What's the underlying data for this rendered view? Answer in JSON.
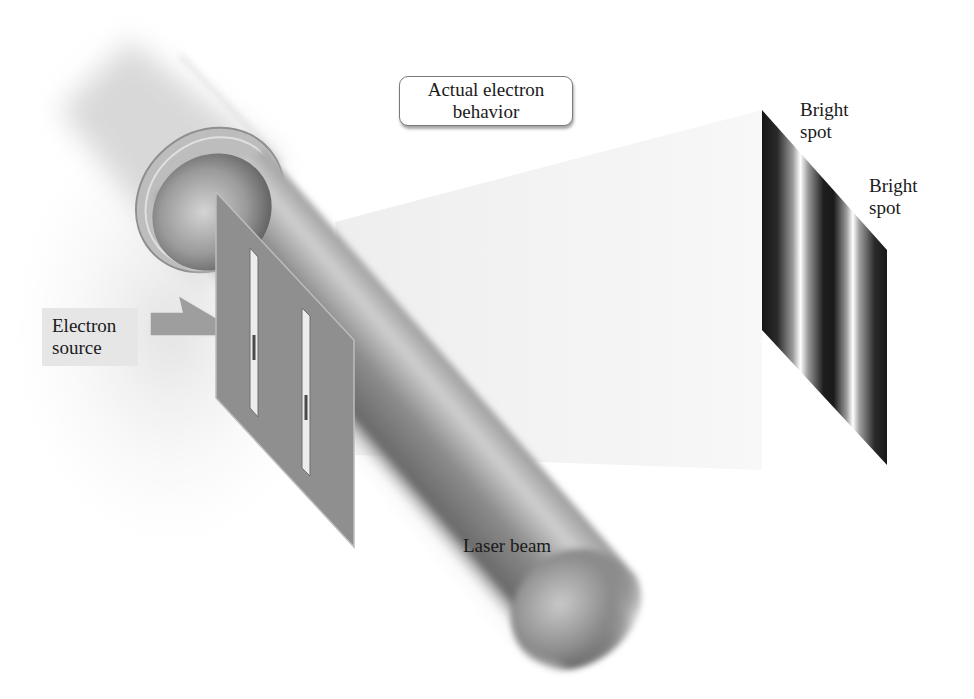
{
  "diagram": {
    "title_callout": {
      "line1": "Actual electron",
      "line2": "behavior"
    },
    "labels": {
      "electron_source": {
        "line1": "Electron",
        "line2": "source"
      },
      "laser_beam": "Laser beam",
      "bright_spot_1": {
        "line1": "Bright",
        "line2": "spot"
      },
      "bright_spot_2": {
        "line1": "Bright",
        "line2": "spot"
      }
    },
    "components": [
      "electron-source-arrow",
      "double-slit-plate",
      "laser-beam-cylinder",
      "detection-screen-interference-pattern",
      "projection-cone"
    ],
    "colors": {
      "background": "#ffffff",
      "plate": "#8c8c8c",
      "beam_dark": "#555555",
      "beam_light": "#d8d8d8",
      "screen_dark": "#111111",
      "screen_bright": "#ffffff",
      "cone": "#f0f0f0",
      "label_box": "#e6e6e6"
    }
  }
}
